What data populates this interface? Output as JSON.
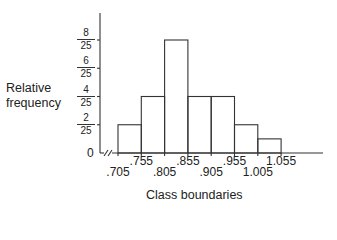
{
  "chart_data": {
    "type": "bar",
    "subtype": "histogram",
    "title": "",
    "xlabel": "Class boundaries",
    "ylabel": "Relative frequency",
    "class_boundaries": [
      ".705",
      ".755",
      ".805",
      ".855",
      ".905",
      ".955",
      "1.005",
      "1.055"
    ],
    "categories": [
      ".705-.755",
      ".755-.805",
      ".805-.855",
      ".855-.905",
      ".905-.955",
      ".955-1.005",
      "1.005-1.055"
    ],
    "values": [
      0.08,
      0.16,
      0.32,
      0.16,
      0.16,
      0.08,
      0.04
    ],
    "values_as_fractions": [
      "2/25",
      "4/25",
      "8/25",
      "4/25",
      "4/25",
      "2/25",
      "1/25"
    ],
    "y_ticks": [
      {
        "num": "8",
        "den": "25",
        "value": 0.32
      },
      {
        "num": "6",
        "den": "25",
        "value": 0.24
      },
      {
        "num": "4",
        "den": "25",
        "value": 0.16
      },
      {
        "num": "2",
        "den": "25",
        "value": 0.08
      }
    ],
    "y_zero_label": "0",
    "ylim": [
      0,
      0.4
    ],
    "axis_break": true,
    "grid": false,
    "legend": null
  },
  "labels": {
    "ylabel_line1": "Relative",
    "ylabel_line2": "frequency",
    "xlabel": "Class boundaries",
    "zero": "0"
  }
}
